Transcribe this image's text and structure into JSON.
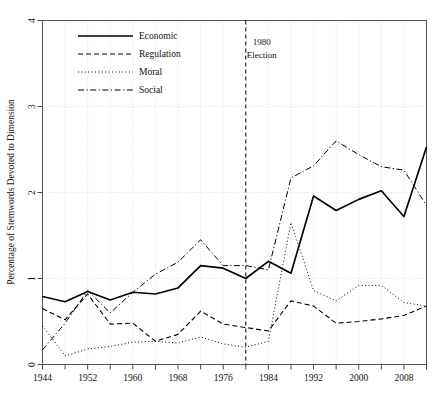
{
  "chart_data": {
    "type": "line",
    "title": "",
    "subtitle": "",
    "xlabel": "",
    "ylabel": "Percentage of Stemwords Devoted to Dimension",
    "xlim": [
      1944,
      2012
    ],
    "ylim": [
      0,
      4
    ],
    "grid": true,
    "legend_position": "top-left",
    "x_tick_labels": [
      "1944",
      "1952",
      "1960",
      "1968",
      "1976",
      "1984",
      "1992",
      "2000",
      "2008"
    ],
    "x_tick_values": [
      1944,
      1952,
      1960,
      1968,
      1976,
      1984,
      1992,
      2000,
      2008
    ],
    "x_minor_ticks": [
      1948,
      1956,
      1964,
      1972,
      1980,
      1988,
      1996,
      2004,
      2012
    ],
    "y_tick_labels": [
      "0",
      "1",
      "2",
      "3",
      "4"
    ],
    "y_tick_values": [
      0,
      1,
      2,
      3,
      4
    ],
    "x": [
      1944,
      1948,
      1952,
      1956,
      1960,
      1964,
      1968,
      1972,
      1976,
      1980,
      1984,
      1988,
      1992,
      1996,
      2000,
      2004,
      2008,
      2012
    ],
    "series": [
      {
        "name": "Economic",
        "style": "solid",
        "values": [
          0.79,
          0.73,
          0.85,
          0.75,
          0.84,
          0.82,
          0.89,
          1.15,
          1.12,
          1.0,
          1.2,
          1.06,
          1.96,
          1.79,
          1.92,
          2.02,
          1.72,
          2.53
        ]
      },
      {
        "name": "Regulation",
        "style": "dashed",
        "values": [
          0.65,
          0.52,
          0.82,
          0.47,
          0.48,
          0.27,
          0.35,
          0.62,
          0.47,
          0.43,
          0.39,
          0.74,
          0.68,
          0.48,
          0.5,
          0.53,
          0.57,
          0.68
        ]
      },
      {
        "name": "Moral",
        "style": "dotted",
        "values": [
          0.45,
          0.1,
          0.18,
          0.21,
          0.26,
          0.27,
          0.25,
          0.32,
          0.24,
          0.2,
          0.27,
          1.65,
          0.86,
          0.74,
          0.92,
          0.92,
          0.72,
          0.68
        ]
      },
      {
        "name": "Social",
        "style": "dashdot",
        "values": [
          0.17,
          0.48,
          0.86,
          0.6,
          0.84,
          1.05,
          1.19,
          1.45,
          1.15,
          1.15,
          1.1,
          2.17,
          2.31,
          2.6,
          2.44,
          2.3,
          2.26,
          1.85
        ]
      }
    ],
    "annotations": [
      {
        "name": "election-marker",
        "x": 1980,
        "lines": [
          "1980",
          "Election"
        ],
        "style": "vertical-dashed-line"
      }
    ]
  },
  "legend": {
    "entries": [
      {
        "label": "Economic"
      },
      {
        "label": "Regulation"
      },
      {
        "label": "Moral"
      },
      {
        "label": "Social"
      }
    ]
  },
  "colors": {
    "line": "#000000",
    "grid": "#c9c9c9",
    "frame": "#555555",
    "background": "#ffffff"
  }
}
